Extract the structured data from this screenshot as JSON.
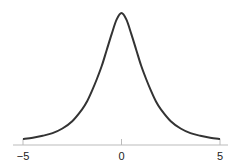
{
  "chart_data": {
    "type": "line",
    "title": "",
    "xlabel": "",
    "ylabel": "",
    "xlim": [
      -5,
      5
    ],
    "ylim": [
      0,
      1
    ],
    "grid": false,
    "legend": null,
    "x_ticks": [
      -5,
      0,
      5
    ],
    "x_tick_labels": [
      "−5",
      "0",
      "5"
    ],
    "y_axis_visible": false,
    "series": [
      {
        "name": "density",
        "color": "#333333",
        "x": [
          -5,
          -4.5,
          -4,
          -3.5,
          -3,
          -2.5,
          -2,
          -1.75,
          -1.5,
          -1.25,
          -1,
          -0.75,
          -0.5,
          -0.25,
          0,
          0.25,
          0.5,
          0.75,
          1,
          1.25,
          1.5,
          1.75,
          2,
          2.5,
          3,
          3.5,
          4,
          4.5,
          5
        ],
        "values": [
          0.045,
          0.055,
          0.07,
          0.09,
          0.125,
          0.18,
          0.27,
          0.33,
          0.41,
          0.5,
          0.6,
          0.72,
          0.84,
          0.95,
          1.0,
          0.95,
          0.84,
          0.72,
          0.6,
          0.5,
          0.41,
          0.33,
          0.27,
          0.18,
          0.125,
          0.09,
          0.07,
          0.055,
          0.045
        ]
      }
    ]
  }
}
